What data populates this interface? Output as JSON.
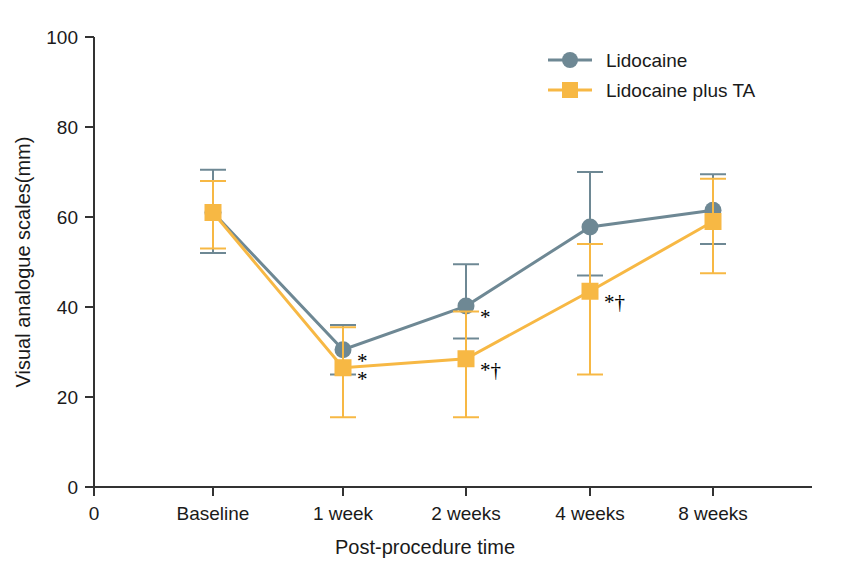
{
  "chart_data": {
    "type": "line",
    "title": "",
    "xlabel": "Post-procedure time",
    "ylabel": "Visual analogue scales(mm)",
    "categories": [
      "Baseline",
      "1 week",
      "2 weeks",
      "4 weeks",
      "8 weeks"
    ],
    "x_origin_label": "0",
    "xtick_labels": [
      "0",
      "Baseline",
      "1 week",
      "2 weeks",
      "4 weeks",
      "8 weeks"
    ],
    "ytick_labels": [
      "0",
      "20",
      "40",
      "60",
      "80",
      "100"
    ],
    "yticks": [
      0,
      20,
      40,
      60,
      80,
      100
    ],
    "ylim": [
      0,
      100
    ],
    "grid": false,
    "legend_position": "top-right",
    "series": [
      {
        "name": "Lidocaine",
        "color": "#6E8894",
        "marker": "circle",
        "values": [
          61.0,
          30.5,
          40.2,
          57.8,
          61.5
        ],
        "err_low": [
          52.0,
          25.0,
          33.0,
          47.0,
          54.0
        ],
        "err_high": [
          70.5,
          36.0,
          49.5,
          70.0,
          69.5
        ],
        "annotations": [
          "",
          "*",
          "*",
          "",
          ""
        ]
      },
      {
        "name": "Lidocaine plus TA",
        "color": "#F7B844",
        "marker": "square",
        "values": [
          61.0,
          26.5,
          28.5,
          43.5,
          59.0
        ],
        "err_low": [
          53.0,
          15.5,
          15.5,
          25.0,
          47.5
        ],
        "err_high": [
          68.0,
          35.5,
          39.0,
          54.0,
          68.5
        ],
        "annotations": [
          "",
          "*",
          "*†",
          "*†",
          ""
        ]
      }
    ]
  },
  "legend": {
    "items": [
      {
        "label": "Lidocaine",
        "color": "#6E8894",
        "marker": "circle"
      },
      {
        "label": "Lidocaine plus TA",
        "color": "#F7B844",
        "marker": "square"
      }
    ]
  },
  "axes": {
    "y_title": "Visual analogue scales(mm)",
    "x_title": "Post-procedure time",
    "y_labels": [
      "100",
      "80",
      "60",
      "40",
      "20",
      "0"
    ],
    "x_labels": [
      "0",
      "Baseline",
      "1 week",
      "2 weeks",
      "4 weeks",
      "8 weeks"
    ],
    "axis_color": "#333333"
  },
  "colors": {
    "lidocaine": "#6E8894",
    "lidocaine_plus_ta": "#F7B844",
    "axis": "#333333",
    "text": "#1a1a1a",
    "background": "#ffffff"
  }
}
